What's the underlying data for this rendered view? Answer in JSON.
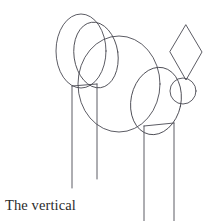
{
  "figure": {
    "background_color": "#ffffff",
    "stroke_color": "#4a4a52",
    "stroke_width": 0.9,
    "width": 212,
    "height": 221
  },
  "caption": {
    "line1": "The vertical",
    "line2": "lines are parallel.",
    "full_text": "The vertical lines are parallel.",
    "color": "#2b2b2b",
    "font_size_px": 14.5
  },
  "shapes": [
    {
      "name": "left-tall-ellipse",
      "type": "ellipse",
      "cx": 81,
      "cy": 51,
      "rx": 25,
      "ry": 37,
      "rotation_deg": 0
    },
    {
      "name": "left-inner-ellipse",
      "type": "ellipse",
      "cx": 96,
      "cy": 55,
      "rx": 22,
      "ry": 33,
      "rotation_deg": -8
    },
    {
      "name": "center-large-circle",
      "type": "ellipse",
      "cx": 119,
      "cy": 84,
      "rx": 41,
      "ry": 48,
      "rotation_deg": 0
    },
    {
      "name": "right-tilted-ellipse",
      "type": "ellipse",
      "cx": 156,
      "cy": 101,
      "rx": 25,
      "ry": 34,
      "rotation_deg": 12
    },
    {
      "name": "small-circle",
      "type": "ellipse",
      "cx": 183,
      "cy": 91,
      "rx": 13,
      "ry": 13,
      "rotation_deg": 0
    },
    {
      "name": "diamond",
      "type": "polygon",
      "points": "186,25 202,52 186,80 170,52"
    }
  ],
  "vertical_lines": [
    {
      "name": "vertical-line-1",
      "x": 72,
      "y_top": 86,
      "y_bottom": 188
    },
    {
      "name": "vertical-line-2",
      "x": 97,
      "y_top": 84,
      "y_bottom": 179
    },
    {
      "name": "vertical-line-3",
      "x": 144,
      "y_top": 126,
      "y_bottom": 221
    },
    {
      "name": "vertical-line-4",
      "x": 174,
      "y_top": 123,
      "y_bottom": 221
    }
  ],
  "connector_lines": [
    {
      "name": "left-connector",
      "x1": 72,
      "y1": 86,
      "x2": 97,
      "y2": 84
    },
    {
      "name": "right-connector",
      "x1": 144,
      "y1": 126,
      "x2": 174,
      "y2": 123
    }
  ]
}
